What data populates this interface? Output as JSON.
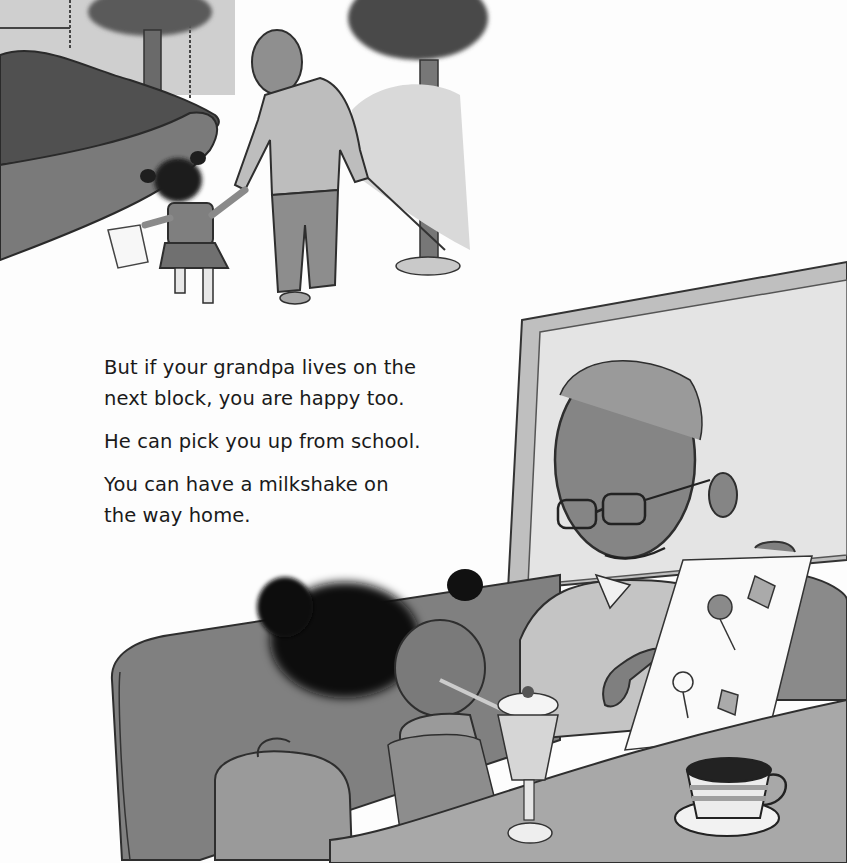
{
  "page": {
    "paragraphs": [
      {
        "lines": [
          "But if your grandpa lives on the",
          "next block, you are happy too."
        ]
      },
      {
        "lines": [
          "He can pick you up from school."
        ]
      },
      {
        "lines": [
          "You can have a milkshake on",
          "the way home."
        ]
      }
    ]
  },
  "illustrations": {
    "top_scene": "grandpa-and-girl-walking-home",
    "bottom_scene": "grandpa-and-girl-at-diner-with-milkshake"
  },
  "colors": {
    "background": "#fdfdfd",
    "text": "#1a1a1a",
    "dark_gray": "#4a4a4a",
    "mid_gray": "#8c8c8c",
    "light_gray": "#c8c8c8"
  }
}
